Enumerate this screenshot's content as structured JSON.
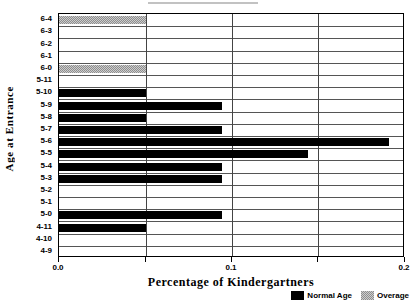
{
  "chart_data": {
    "type": "bar",
    "orientation": "horizontal",
    "title": "",
    "xlabel": "Percentage of Kindergartners",
    "ylabel": "Age at Entrance",
    "xlim": [
      0.0,
      0.2
    ],
    "ylim": null,
    "grid": "vertical-and-row-separators",
    "legend_position": "bottom-right",
    "x_ticks": [
      {
        "value": 0.0,
        "label": "0.0"
      },
      {
        "value": 0.05,
        "label": ""
      },
      {
        "value": 0.1,
        "label": "0.1"
      },
      {
        "value": 0.15,
        "label": ""
      },
      {
        "value": 0.2,
        "label": "0.2"
      }
    ],
    "categories": [
      "6-4",
      "6-3",
      "6-2",
      "6-1",
      "6-0",
      "5-11",
      "5-10",
      "5-9",
      "5-8",
      "5-7",
      "5-6",
      "5-5",
      "5-4",
      "5-3",
      "5-2",
      "5-1",
      "5-0",
      "4-11",
      "4-10",
      "4-9"
    ],
    "series": [
      {
        "name": "Normal Age",
        "color": "#000000",
        "values": [
          0,
          0,
          0,
          0,
          0,
          0,
          0.05,
          0.094,
          0.05,
          0.094,
          0.191,
          0.144,
          0.094,
          0.094,
          0,
          0,
          0.094,
          0.05,
          0,
          0
        ]
      },
      {
        "name": "Overage",
        "color": "#8e8e8e",
        "values": [
          0.05,
          0,
          0,
          0,
          0.05,
          0,
          0,
          0,
          0,
          0,
          0,
          0,
          0,
          0,
          0,
          0,
          0,
          0,
          0,
          0
        ]
      }
    ]
  },
  "legend": {
    "entries": [
      {
        "label": "Normal Age",
        "swatch": "normal"
      },
      {
        "label": "Overage",
        "swatch": "overage"
      }
    ]
  }
}
